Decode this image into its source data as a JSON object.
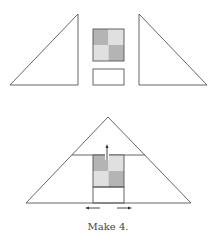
{
  "diagram": {
    "caption": "Make 4.",
    "colors": {
      "stroke": "#555555",
      "dark_gray": "#b4b4b4",
      "light_gray": "#e0e0e0",
      "background": "#ffffff"
    },
    "top_row": {
      "pieces": [
        "left-right-triangle",
        "2x2-checkered-square",
        "rectangle",
        "right-right-triangle"
      ]
    },
    "assembled": {
      "shape": "large-isosceles-triangle",
      "arrows": [
        "up",
        "left",
        "right"
      ]
    }
  }
}
